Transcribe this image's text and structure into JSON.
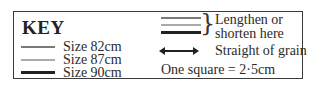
{
  "key": {
    "title": "KEY",
    "sizes": [
      {
        "label": "Size 82cm",
        "color": "#7a7a7a",
        "style": "medium grey line"
      },
      {
        "label": "Size 87cm",
        "color": "#aaaaaa",
        "style": "light grey line"
      },
      {
        "label": "Size 90cm",
        "color": "#222222",
        "style": "thick black line"
      }
    ],
    "lengthen_label": "Lengthen or shorten here",
    "grain_label": "Straight of grain",
    "scale_label": "One square = 2·5cm"
  }
}
